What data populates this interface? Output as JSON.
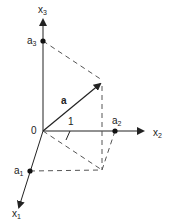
{
  "diagram": {
    "title": "",
    "origin_label": "0",
    "vector_label": "a",
    "unit_label": "1",
    "axes": [
      {
        "id": "x1",
        "base": "x",
        "sub": "1"
      },
      {
        "id": "x2",
        "base": "x",
        "sub": "2"
      },
      {
        "id": "x3",
        "base": "x",
        "sub": "3"
      }
    ],
    "components": [
      {
        "id": "a1",
        "base": "a",
        "sub": "1"
      },
      {
        "id": "a2",
        "base": "a",
        "sub": "2"
      },
      {
        "id": "a3",
        "base": "a",
        "sub": "3"
      }
    ],
    "colors": {
      "line": "#222222",
      "dashed": "#555555",
      "background": "#ffffff"
    }
  }
}
